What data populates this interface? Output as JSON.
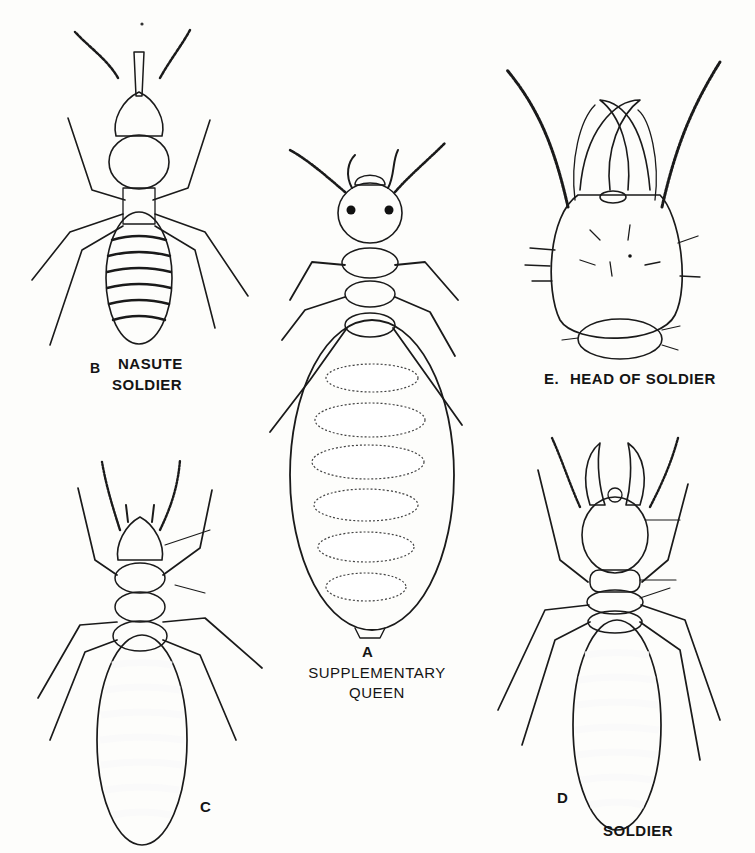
{
  "plate": {
    "figures": [
      {
        "id": "A",
        "letter": "A",
        "caption_lines": [
          "SUPPLEMENTARY",
          "QUEEN"
        ]
      },
      {
        "id": "B",
        "letter": "B",
        "caption_lines": [
          "NASUTE",
          "SOLDIER"
        ]
      },
      {
        "id": "C",
        "letter": "C",
        "caption_lines": []
      },
      {
        "id": "D",
        "letter": "D",
        "caption_lines": [
          "SOLDIER"
        ]
      },
      {
        "id": "E",
        "letter": "E",
        "caption_lines": [
          "HEAD OF SOLDIER"
        ]
      }
    ],
    "labels": {
      "b_letter": "B",
      "b_line1": "NASUTE",
      "b_line2": "SOLDIER",
      "e_letter": "E.",
      "e_caption": "HEAD OF SOLDIER",
      "a_letter": "A",
      "a_line1": "SUPPLEMENTARY",
      "a_line2": "QUEEN",
      "c_letter": "C",
      "d_letter": "D",
      "d_caption": "SOLDIER"
    },
    "colors": {
      "paper": "#fdfdfb",
      "ink": "#1a1a1a",
      "stipple": "#6a6a6a"
    }
  }
}
